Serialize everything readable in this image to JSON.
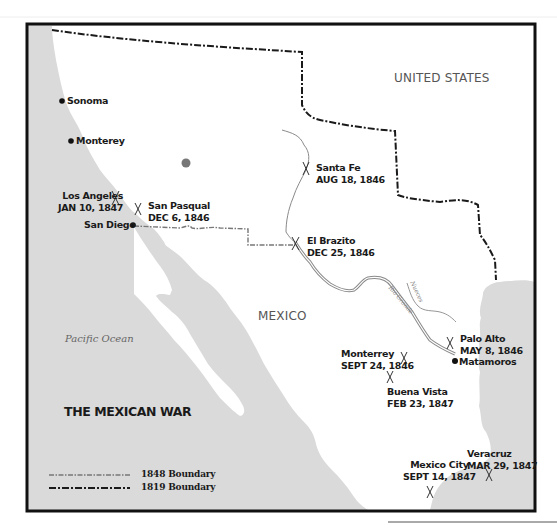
{
  "map": {
    "title": "THE MEXICAN WAR",
    "countries": [
      {
        "label": "UNITED STATES"
      },
      {
        "label": "MEXICO"
      }
    ],
    "water_labels": [
      {
        "label": "Pacific Ocean"
      }
    ],
    "rivers": [
      {
        "label": "Rio Grande"
      },
      {
        "label": "Nueces"
      }
    ],
    "cities": [
      {
        "name": "Sonoma"
      },
      {
        "name": "Monterey"
      },
      {
        "name": "San Diego"
      },
      {
        "name": "Matamoros"
      }
    ],
    "battles": [
      {
        "name": "Los Angeles",
        "date": "JAN 10, 1847"
      },
      {
        "name": "San Pasqual",
        "date": "DEC 6, 1846"
      },
      {
        "name": "Santa Fe",
        "date": "AUG 18, 1846"
      },
      {
        "name": "El Brazito",
        "date": "DEC 25, 1846"
      },
      {
        "name": "Palo Alto",
        "date": "MAY 8, 1846"
      },
      {
        "name": "Monterrey",
        "date": "SEPT 24, 1846"
      },
      {
        "name": "Buena Vista",
        "date": "FEB 23, 1847"
      },
      {
        "name": "Mexico City",
        "date": "SEPT 14, 1847"
      },
      {
        "name": "Veracruz",
        "date": "MAR 29, 1847"
      }
    ],
    "legend": [
      {
        "label": "1848 Boundary",
        "style": "dash-dot-thin"
      },
      {
        "label": "1819 Boundary",
        "style": "dash-dot-thick"
      }
    ],
    "colors": {
      "water": "#dadada",
      "land": "#ffffff",
      "border": "#111111",
      "boundary_1819": "#1a1a1a",
      "boundary_1848": "#777777",
      "river": "#8a8a8a",
      "marker": "#777777"
    }
  }
}
